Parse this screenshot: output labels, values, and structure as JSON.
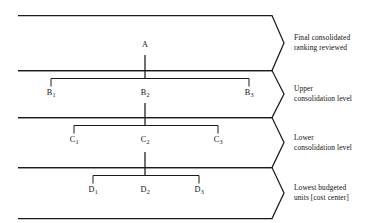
{
  "diagram": {
    "type": "layered-chevron-hierarchy",
    "colors": {
      "background": "#ffffff",
      "line": "#1a1a1a",
      "text": "#111111"
    },
    "bands": [
      {
        "id": "band-a",
        "caption_line1": "Final consolidated",
        "caption_line2": "ranking reviewed",
        "caption": "Final consolidated\nranking reviewed"
      },
      {
        "id": "band-b",
        "caption_line1": "Upper",
        "caption_line2": "consolidation level",
        "caption": "Upper\nconsolidation level"
      },
      {
        "id": "band-c",
        "caption_line1": "Lower",
        "caption_line2": "consolidation level",
        "caption": "Lower\nconsolidation level"
      },
      {
        "id": "band-d",
        "caption_line1": "Lowest budgeted",
        "caption_line2": "units [cost center]",
        "caption": "Lowest budgeted\nunits [cost center]"
      }
    ],
    "nodes": {
      "a": {
        "base": "A",
        "sub": ""
      },
      "b1": {
        "base": "B",
        "sub": "1"
      },
      "b2": {
        "base": "B",
        "sub": "2"
      },
      "b3": {
        "base": "B",
        "sub": "3"
      },
      "c1": {
        "base": "C",
        "sub": "1"
      },
      "c2": {
        "base": "C",
        "sub": "2"
      },
      "c3": {
        "base": "C",
        "sub": "3"
      },
      "d1": {
        "base": "D",
        "sub": "1"
      },
      "d2": {
        "base": "D",
        "sub": "2"
      },
      "d3": {
        "base": "D",
        "sub": "3"
      }
    }
  }
}
